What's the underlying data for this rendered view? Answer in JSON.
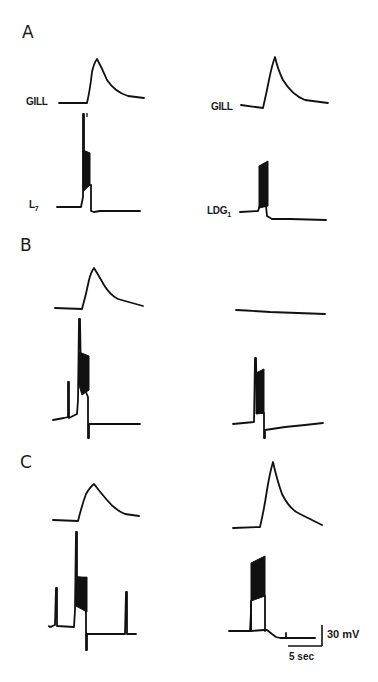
{
  "figure": {
    "panels": [
      {
        "letter": "A",
        "left": {
          "upper_label": "GILL",
          "lower_label_main": "L",
          "lower_label_sub": "7"
        },
        "right": {
          "upper_label": "GILL",
          "lower_label_main": "LDG",
          "lower_label_sub": "1"
        }
      },
      {
        "letter": "B",
        "left": {
          "upper_label": "",
          "lower_label_main": "",
          "lower_label_sub": ""
        },
        "right": {
          "upper_label": "",
          "lower_label_main": "",
          "lower_label_sub": ""
        }
      },
      {
        "letter": "C",
        "left": {
          "upper_label": "",
          "lower_label_main": "",
          "lower_label_sub": ""
        },
        "right": {
          "upper_label": "",
          "lower_label_main": "",
          "lower_label_sub": ""
        }
      }
    ],
    "scale_bar": {
      "voltage": "30 mV",
      "time": "5 sec"
    }
  }
}
